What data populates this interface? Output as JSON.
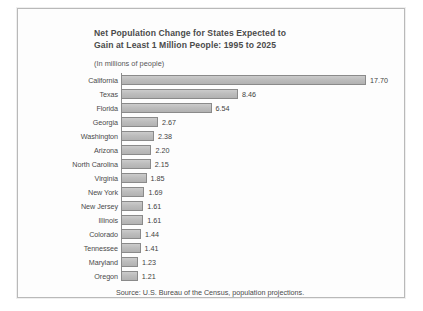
{
  "chart_data": {
    "type": "bar",
    "orientation": "horizontal",
    "title": "Net Population Change for States Expected to Gain at Least 1 Million People:  1995 to 2025",
    "title_line1": "Net Population Change for States Expected to",
    "title_line2": "Gain at Least 1 Million People:  1995 to 2025",
    "subtitle": "(In millions of people)",
    "xlabel": "",
    "ylabel": "",
    "units": "millions of people",
    "xlim": [
      0,
      17.7
    ],
    "grid": false,
    "legend": null,
    "source": "Source:  U.S. Bureau of the Census, population projections.",
    "categories": [
      "California",
      "Texas",
      "Florida",
      "Georgia",
      "Washington",
      "Arizona",
      "North Carolina",
      "Virginia",
      "New York",
      "New Jersey",
      "Illinois",
      "Colorado",
      "Tennessee",
      "Maryland",
      "Oregon"
    ],
    "values": [
      17.7,
      8.46,
      6.54,
      2.67,
      2.38,
      2.2,
      2.15,
      1.85,
      1.69,
      1.61,
      1.61,
      1.44,
      1.41,
      1.23,
      1.21
    ],
    "value_labels": [
      "17.70",
      "8.46",
      "6.54",
      "2.67",
      "2.38",
      "2.20",
      "2.15",
      "1.85",
      "1.69",
      "1.61",
      "1.61",
      "1.44",
      "1.41",
      "1.23",
      "1.21"
    ],
    "bars": [
      {
        "label": "California",
        "value": 17.7,
        "display": "17.70"
      },
      {
        "label": "Texas",
        "value": 8.46,
        "display": "8.46"
      },
      {
        "label": "Florida",
        "value": 6.54,
        "display": "6.54"
      },
      {
        "label": "Georgia",
        "value": 2.67,
        "display": "2.67"
      },
      {
        "label": "Washington",
        "value": 2.38,
        "display": "2.38"
      },
      {
        "label": "Arizona",
        "value": 2.2,
        "display": "2.20"
      },
      {
        "label": "North Carolina",
        "value": 2.15,
        "display": "2.15"
      },
      {
        "label": "Virginia",
        "value": 1.85,
        "display": "1.85"
      },
      {
        "label": "New York",
        "value": 1.69,
        "display": "1.69"
      },
      {
        "label": "New Jersey",
        "value": 1.61,
        "display": "1.61"
      },
      {
        "label": "Illinois",
        "value": 1.61,
        "display": "1.61"
      },
      {
        "label": "Colorado",
        "value": 1.44,
        "display": "1.44"
      },
      {
        "label": "Tennessee",
        "value": 1.41,
        "display": "1.41"
      },
      {
        "label": "Maryland",
        "value": 1.23,
        "display": "1.23"
      },
      {
        "label": "Oregon",
        "value": 1.21,
        "display": "1.21"
      }
    ],
    "colors": {
      "bar_fill": "#bdbdbd",
      "bar_border": "#8a8a8a",
      "text": "#4a4a4a",
      "frame": "#b9b9b9",
      "background": "#fdfdfd"
    }
  }
}
